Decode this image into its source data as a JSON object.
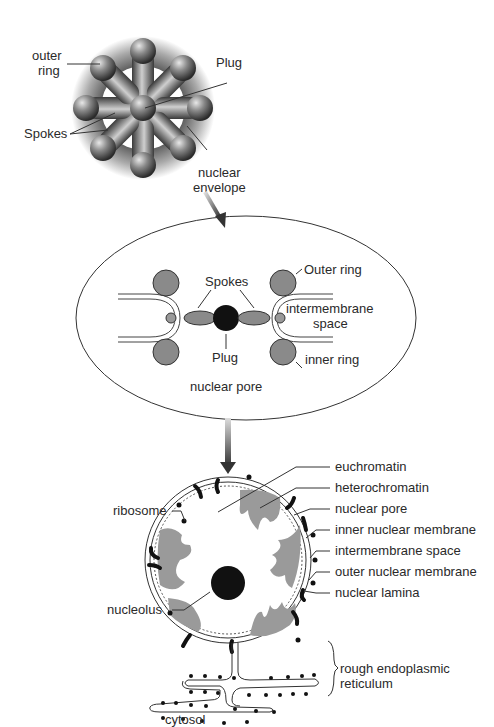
{
  "panel1": {
    "title": "nuclear pore complex top view",
    "labels": {
      "outer_ring_l1": "outer",
      "outer_ring_l2": "ring",
      "plug": "Plug",
      "spokes": "Spokes",
      "nuclear_envelope_l1": "nuclear",
      "nuclear_envelope_l2": "envelope"
    }
  },
  "panel2": {
    "title": "nuclear pore",
    "labels": {
      "spokes": "Spokes",
      "outer_ring": "Outer ring",
      "intermembrane_l1": "intermembrane",
      "intermembrane_l2": "space",
      "plug": "Plug",
      "inner_ring": "inner ring",
      "caption": "nuclear pore"
    }
  },
  "panel3": {
    "labels": {
      "euchromatin": "euchromatin",
      "heterochromatin": "heterochromatin",
      "nuclear_pore": "nuclear pore",
      "inner_nuclear_membrane": "inner nuclear membrane",
      "intermembrane_space": "intermembrane space",
      "outer_nuclear_membrane": "outer nuclear membrane",
      "nuclear_lamina": "nuclear lamina",
      "ribosome": "ribosome",
      "nucleolus": "nucleolus",
      "rer_l1": "rough endoplasmic",
      "rer_l2": "reticulum",
      "cytosol": "cytosol"
    }
  },
  "colors": {
    "heterochromatin": "#9a9a9a",
    "nucleolus": "#1a1a1a",
    "sphere": "#777777",
    "line": "#333333"
  }
}
